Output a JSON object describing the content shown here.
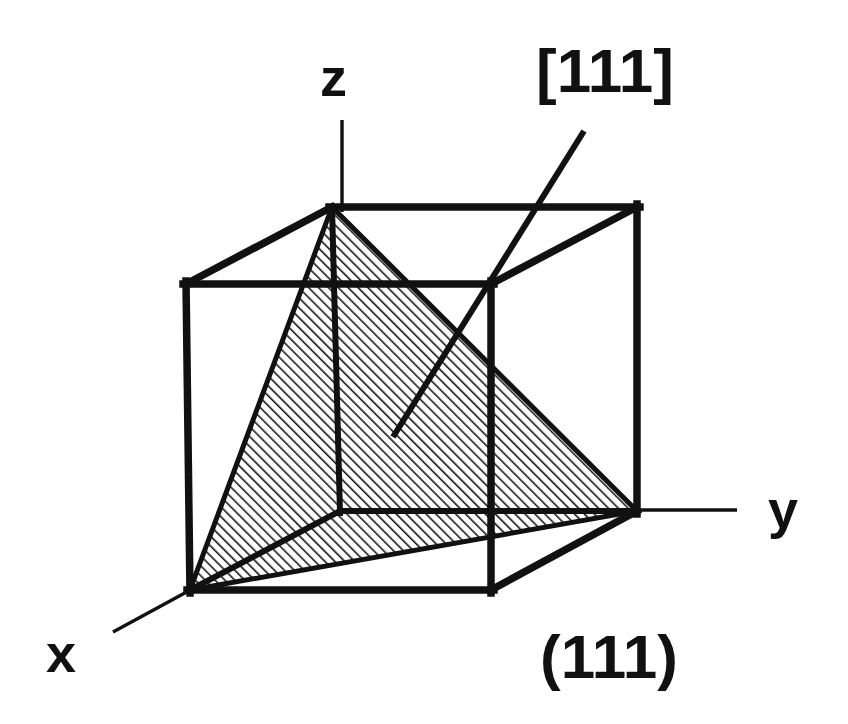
{
  "figure": {
    "background_color": "#ffffff",
    "ink_color": "#111111",
    "width": 848,
    "height": 724
  },
  "axes": {
    "x": {
      "label": "x",
      "label_pos": {
        "x": 46,
        "y": 672
      },
      "line": {
        "x1": 190,
        "y1": 590,
        "x2": 113,
        "y2": 632
      }
    },
    "y": {
      "label": "y",
      "label_pos": {
        "x": 768,
        "y": 528
      },
      "line": {
        "x1": 637,
        "y1": 510,
        "x2": 737,
        "y2": 510
      }
    },
    "z": {
      "label": "z",
      "label_pos": {
        "x": 320,
        "y": 96
      },
      "line": {
        "x1": 342,
        "y1": 120,
        "x2": 342,
        "y2": 208
      }
    }
  },
  "cube": {
    "stroke_width": 7,
    "front": {
      "top_left": {
        "x": 186,
        "y": 284
      },
      "top_right": {
        "x": 491,
        "y": 284
      },
      "bottom_right": {
        "x": 491,
        "y": 590
      },
      "bottom_left": {
        "x": 190,
        "y": 590
      }
    },
    "back": {
      "top_left": {
        "x": 332,
        "y": 207
      },
      "top_right": {
        "x": 637,
        "y": 207
      },
      "bottom_right": {
        "x": 637,
        "y": 511
      },
      "bottom_left": {
        "x": 340,
        "y": 511
      }
    }
  },
  "plane": {
    "name": "(111)",
    "label": "(111)",
    "label_pos": {
      "x": 540,
      "y": 678
    },
    "fill": "hatch-45",
    "hatch_spacing_px": 7,
    "vertices": [
      {
        "x": 332,
        "y": 207
      },
      {
        "x": 637,
        "y": 511
      },
      {
        "x": 190,
        "y": 590
      }
    ]
  },
  "direction": {
    "name": "[111]",
    "label": "[111]",
    "label_pos": {
      "x": 536,
      "y": 92
    },
    "line": {
      "x1": 393,
      "y1": 437,
      "x2": 584,
      "y2": 131
    },
    "stroke_width": 6
  }
}
